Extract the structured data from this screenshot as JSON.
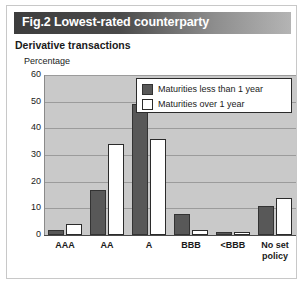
{
  "figure": {
    "tag_and_title": "Fig.2 Lowest-rated counterparty",
    "subtitle": "Derivative transactions"
  },
  "chart_data": {
    "type": "bar",
    "title": "Fig.2 Lowest-rated counterparty",
    "subtitle": "Derivative transactions",
    "xlabel": "",
    "ylabel": "Percentage",
    "ylim": [
      0,
      60
    ],
    "yticks": [
      0,
      10,
      20,
      30,
      40,
      50,
      60
    ],
    "grid": true,
    "legend_position": "upper right",
    "categories": [
      "AAA",
      "AA",
      "A",
      "BBB",
      "<BBB",
      "No set policy"
    ],
    "series": [
      {
        "name": "Maturities less than 1 year",
        "color": "#585858",
        "values": [
          2,
          17,
          49,
          8,
          1,
          11
        ]
      },
      {
        "name": "Maturities over 1 year",
        "color": "#ffffff",
        "values": [
          4,
          34,
          36,
          2,
          1,
          14
        ]
      }
    ]
  },
  "axis": {
    "ytick_labels": [
      "60",
      "50",
      "40",
      "30",
      "20",
      "10",
      "0"
    ],
    "xtick_labels": [
      "AAA",
      "AA",
      "A",
      "BBB",
      "<BBB",
      "No set policy"
    ]
  },
  "legend": {
    "items": [
      {
        "label": "Maturities less than 1 year",
        "swatch": "dark"
      },
      {
        "label": "Maturities over 1 year",
        "swatch": "light"
      }
    ]
  }
}
